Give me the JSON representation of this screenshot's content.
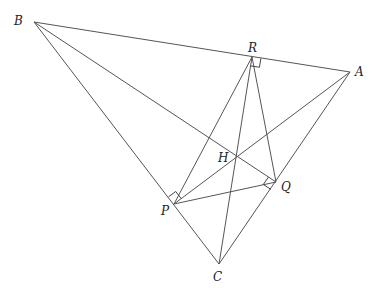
{
  "diagram": {
    "type": "geometry",
    "points": {
      "A": {
        "label": "A",
        "x": 350,
        "y": 72,
        "lx": 355,
        "ly": 76
      },
      "B": {
        "label": "B",
        "x": 34,
        "y": 22,
        "lx": 14,
        "ly": 25
      },
      "C": {
        "label": "C",
        "x": 219,
        "y": 264,
        "lx": 213,
        "ly": 281
      },
      "R": {
        "label": "R",
        "x": 252,
        "y": 57,
        "lx": 248,
        "ly": 52
      },
      "H": {
        "label": "H",
        "x": 236,
        "y": 157,
        "lx": 218,
        "ly": 162
      },
      "Q": {
        "label": "Q",
        "x": 276,
        "y": 182,
        "lx": 281,
        "ly": 191
      },
      "P": {
        "label": "P",
        "x": 174,
        "y": 204,
        "lx": 161,
        "ly": 215
      }
    },
    "segments": [
      [
        "B",
        "A"
      ],
      [
        "B",
        "C"
      ],
      [
        "C",
        "A"
      ],
      [
        "A",
        "P"
      ],
      [
        "B",
        "Q"
      ],
      [
        "C",
        "R"
      ],
      [
        "P",
        "Q"
      ],
      [
        "Q",
        "R"
      ],
      [
        "R",
        "P"
      ]
    ],
    "right_angles": [
      "P",
      "Q",
      "R"
    ]
  }
}
